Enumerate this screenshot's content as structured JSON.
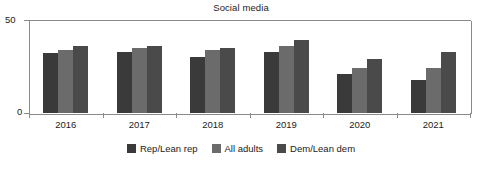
{
  "chart_data": {
    "type": "bar",
    "title": "Social media",
    "xlabel": "",
    "ylabel": "",
    "categories": [
      "2016",
      "2017",
      "2018",
      "2019",
      "2020",
      "2021"
    ],
    "series": [
      {
        "name": "Rep/Lean rep",
        "color": "#3a3a3a",
        "values": [
          32,
          33,
          30,
          33,
          21,
          18
        ]
      },
      {
        "name": "All adults",
        "color": "#6b6b6b",
        "values": [
          34,
          35,
          34,
          36,
          24,
          24
        ]
      },
      {
        "name": "Dem/Lean dem",
        "color": "#4a4a4a",
        "values": [
          36,
          36,
          35,
          39,
          29,
          33
        ]
      }
    ],
    "ylim": [
      0,
      50
    ],
    "yticks": [
      "0",
      "50"
    ],
    "grid": false,
    "legend_position": "bottom"
  },
  "axis": {
    "y_top_label": "50",
    "y_bottom_label": "0"
  },
  "colors": {
    "axis": "#8a8a8a",
    "text": "#222222",
    "background": "#ffffff"
  }
}
